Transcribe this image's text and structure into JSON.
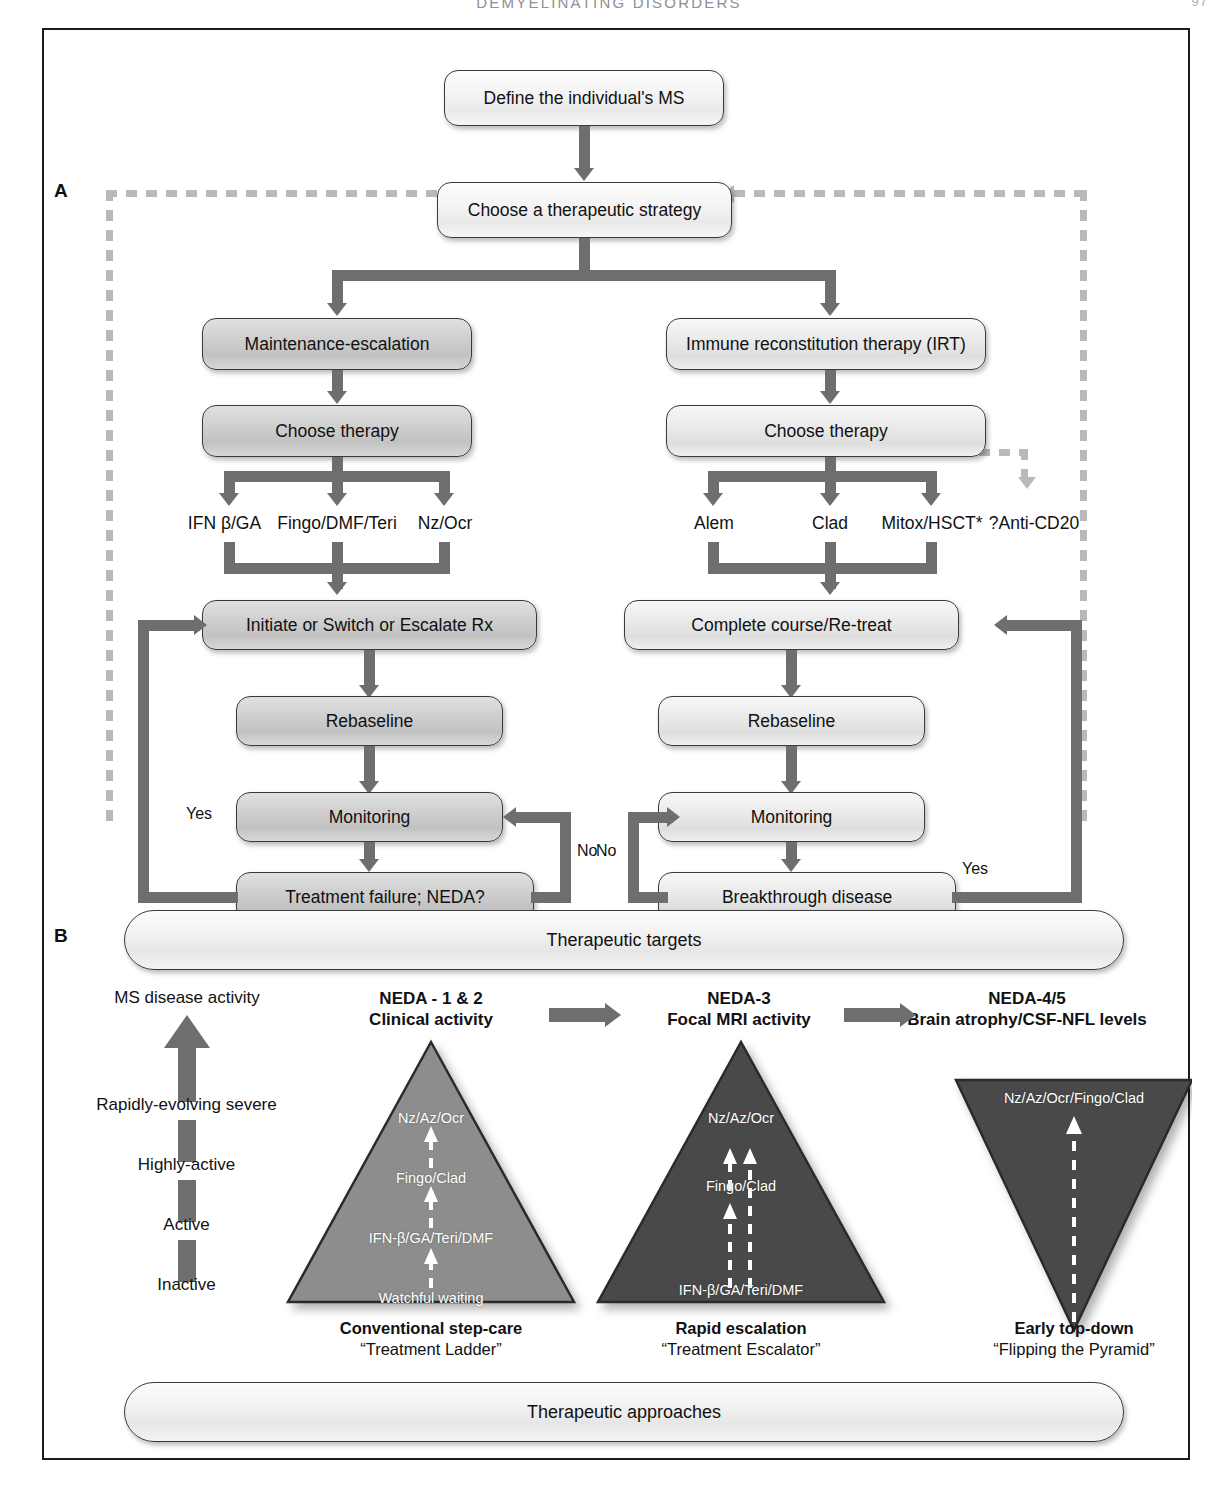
{
  "running_head": {
    "text": "DEMYELINATING DISORDERS",
    "folio": "97"
  },
  "panels": {
    "a_letter": "A",
    "b_letter": "B"
  },
  "panel_a": {
    "nodes": {
      "define": "Define the individual's MS",
      "choose_strategy": "Choose a therapeutic strategy",
      "maintenance": "Maintenance-escalation",
      "irt": "Immune reconstitution therapy (IRT)",
      "choose_therapy_left": "Choose therapy",
      "choose_therapy_right": "Choose therapy",
      "initiate": "Initiate or Switch or Escalate Rx",
      "complete_course": "Complete course/Re-treat",
      "rebaseline_left": "Rebaseline",
      "rebaseline_right": "Rebaseline",
      "monitoring_left": "Monitoring",
      "monitoring_right": "Monitoring",
      "treatment_failure": "Treatment failure; NEDA?",
      "breakthrough": "Breakthrough disease"
    },
    "left_drugs": [
      "IFN β/GA",
      "Fingo/DMF/Teri",
      "Nz/Ocr"
    ],
    "right_drugs": [
      "Alem",
      "Clad",
      "Mitox/HSCT*",
      "?Anti-CD20"
    ],
    "edge_labels": {
      "yes_left": "Yes",
      "no_left": "No",
      "no_right": "No",
      "yes_right": "Yes"
    }
  },
  "panel_b": {
    "top_bar": "Therapeutic targets",
    "bottom_bar": "Therapeutic approaches",
    "axis": {
      "title": "MS disease activity",
      "levels": [
        "Rapidly-evolving severe",
        "Highly-active",
        "Active",
        "Inactive"
      ]
    },
    "stages": [
      {
        "title": "NEDA - 1 & 2",
        "subtitle": "Clinical activity"
      },
      {
        "title": "NEDA-3",
        "subtitle": "Focal MRI activity"
      },
      {
        "title": "NEDA-4/5",
        "subtitle": "Brain atrophy/CSF-NFL levels"
      }
    ],
    "triangles": [
      {
        "id": "conventional",
        "orientation": "up",
        "fill": "#8d8d8d",
        "steps": [
          "Nz/Az/Ocr",
          "Fingo/Clad",
          "IFN-β/GA/Teri/DMF",
          "Watchful waiting"
        ],
        "caption_title": "Conventional step-care",
        "caption_sub": "“Treatment Ladder”"
      },
      {
        "id": "rapid",
        "orientation": "up",
        "fill": "#4a4a4a",
        "steps": [
          "Nz/Az/Ocr",
          "Fingo/Clad",
          "IFN-β/GA/Teri/DMF"
        ],
        "caption_title": "Rapid escalation",
        "caption_sub": "“Treatment Escalator”"
      },
      {
        "id": "topdown",
        "orientation": "down",
        "fill": "#4a4a4a",
        "steps": [
          "Nz/Az/Ocr/Fingo/Clad"
        ],
        "caption_title": "Early top-down",
        "caption_sub": "“Flipping the Pyramid”"
      }
    ]
  },
  "colors": {
    "line": "#6e6e6e",
    "dashed": "#b9b9b9",
    "frame": "#1a1a1a",
    "triangle_light": "#8d8d8d",
    "triangle_dark": "#4a4a4a"
  }
}
